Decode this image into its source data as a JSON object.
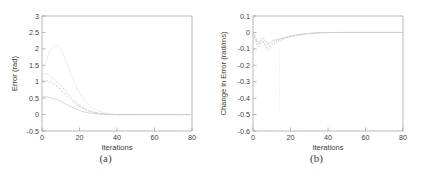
{
  "figure": {
    "background": "#ffffff",
    "curve_color": "#c9c9c9",
    "axis_color": "#9a9a9a"
  },
  "panels": [
    {
      "caption": "(a)",
      "name": "panel-a"
    },
    {
      "caption": "(b)",
      "name": "panel-b"
    }
  ],
  "chart_data": [
    {
      "type": "line",
      "panel_label": "(a)",
      "title": "",
      "xlabel": "Iterations",
      "ylabel": "Error (rad)",
      "xlim": [
        0,
        80
      ],
      "ylim": [
        -0.5,
        3
      ],
      "xticks": [
        0,
        20,
        40,
        60,
        80
      ],
      "xtick_labels": [
        "0",
        "20",
        "40",
        "60",
        "80"
      ],
      "yticks": [
        -0.5,
        0,
        0.5,
        1,
        1.5,
        2,
        2.5,
        3
      ],
      "ytick_labels": [
        "-0.5",
        "0",
        "0.5",
        "1",
        "1.5",
        "2",
        "2.5",
        "3"
      ],
      "grid": false,
      "legend": "none",
      "x": [
        0,
        2,
        4,
        6,
        8,
        10,
        12,
        14,
        16,
        18,
        20,
        24,
        28,
        32,
        36,
        40,
        50,
        60,
        70,
        80
      ],
      "series": [
        {
          "name": "error-curve-1",
          "style": "solid",
          "values": [
            0.55,
            0.54,
            0.52,
            0.49,
            0.45,
            0.4,
            0.34,
            0.28,
            0.22,
            0.17,
            0.12,
            0.06,
            0.03,
            0.01,
            0.005,
            0.0,
            0.0,
            0.0,
            0.0,
            0.0
          ]
        },
        {
          "name": "error-curve-2",
          "style": "dashed",
          "values": [
            1.05,
            1.04,
            1.0,
            0.94,
            0.86,
            0.76,
            0.65,
            0.54,
            0.43,
            0.33,
            0.25,
            0.13,
            0.06,
            0.025,
            0.01,
            0.0,
            0.0,
            0.0,
            0.0,
            0.0
          ]
        },
        {
          "name": "error-curve-3",
          "style": "dotted",
          "values": [
            1.25,
            1.23,
            1.18,
            1.1,
            1.0,
            0.89,
            0.76,
            0.63,
            0.5,
            0.39,
            0.29,
            0.15,
            0.07,
            0.03,
            0.012,
            0.0,
            0.0,
            0.0,
            0.0,
            0.0
          ]
        },
        {
          "name": "error-curve-faint-overshoot",
          "style": "faint",
          "values": [
            1.3,
            1.6,
            1.9,
            2.05,
            2.1,
            2.0,
            1.75,
            1.45,
            1.15,
            0.88,
            0.66,
            0.35,
            0.17,
            0.07,
            0.02,
            0.0,
            0.0,
            0.0,
            0.0,
            0.0
          ]
        }
      ]
    },
    {
      "type": "line",
      "panel_label": "(b)",
      "title": "",
      "xlabel": "Iterations",
      "ylabel": "Change in Error (rad/ms)",
      "xlim": [
        0,
        80
      ],
      "ylim": [
        -0.6,
        0.1
      ],
      "xticks": [
        0,
        20,
        40,
        60,
        80
      ],
      "xtick_labels": [
        "0",
        "20",
        "40",
        "60",
        "80"
      ],
      "yticks": [
        -0.6,
        -0.5,
        -0.4,
        -0.3,
        -0.2,
        -0.1,
        0,
        0.1
      ],
      "ytick_labels": [
        "-0.6",
        "-0.5",
        "-0.4",
        "-0.3",
        "-0.2",
        "-0.1",
        "0",
        "0.1"
      ],
      "grid": false,
      "legend": "none",
      "annotation": "vertical spike near iteration 14 reaching about -0.5",
      "x": [
        0,
        1,
        2,
        3,
        4,
        5,
        6,
        7,
        8,
        9,
        10,
        12,
        14,
        16,
        18,
        20,
        24,
        28,
        32,
        36,
        40,
        50,
        60,
        70,
        80
      ],
      "series": [
        {
          "name": "change-curve-1",
          "style": "solid",
          "values": [
            0.0,
            -0.02,
            -0.045,
            -0.06,
            -0.05,
            -0.035,
            -0.045,
            -0.06,
            -0.07,
            -0.065,
            -0.055,
            -0.045,
            -0.04,
            -0.033,
            -0.027,
            -0.022,
            -0.014,
            -0.008,
            -0.004,
            -0.002,
            -0.001,
            0.0,
            0.0,
            0.0,
            0.0
          ]
        },
        {
          "name": "change-curve-2",
          "style": "dashed",
          "values": [
            0.0,
            -0.03,
            -0.06,
            -0.075,
            -0.06,
            -0.05,
            -0.065,
            -0.085,
            -0.095,
            -0.085,
            -0.07,
            -0.055,
            -0.046,
            -0.038,
            -0.031,
            -0.025,
            -0.016,
            -0.009,
            -0.005,
            -0.002,
            -0.001,
            0.0,
            0.0,
            0.0,
            0.0
          ]
        },
        {
          "name": "change-curve-3",
          "style": "dotted",
          "values": [
            0.0,
            -0.04,
            -0.075,
            -0.09,
            -0.07,
            -0.055,
            -0.075,
            -0.1,
            -0.11,
            -0.1,
            -0.08,
            -0.06,
            -0.05,
            -0.042,
            -0.034,
            -0.028,
            -0.018,
            -0.01,
            -0.005,
            -0.002,
            -0.001,
            0.0,
            0.0,
            0.0,
            0.0
          ]
        }
      ]
    }
  ]
}
